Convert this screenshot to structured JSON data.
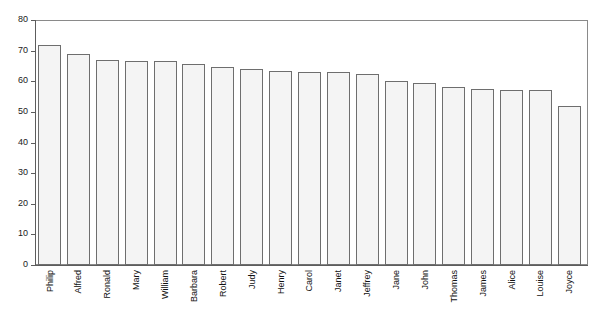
{
  "chart_data": {
    "type": "bar",
    "title": "",
    "subtitle": "",
    "xlabel": "",
    "ylabel": "",
    "ylim": [
      0,
      80
    ],
    "yticks": [
      0,
      10,
      20,
      30,
      40,
      50,
      60,
      70,
      80
    ],
    "ytick_labels": [
      "0",
      "10",
      "20",
      "30",
      "40",
      "50",
      "60",
      "70",
      "80"
    ],
    "grid": false,
    "legend": null,
    "categories": [
      "Philip",
      "Alfred",
      "Ronald",
      "Mary",
      "William",
      "Barbara",
      "Robert",
      "Judy",
      "Henry",
      "Carol",
      "Janet",
      "Jeffrey",
      "Jane",
      "John",
      "Thomas",
      "James",
      "Alice",
      "Louise",
      "Joyce"
    ],
    "values": [
      72,
      69,
      67,
      66.5,
      66.5,
      65.5,
      64.5,
      64,
      63.5,
      63,
      63,
      62.5,
      60,
      59.5,
      58,
      57.5,
      57,
      57,
      52
    ],
    "bar_fill_color": "#f4f4f4",
    "bar_border_color": "#6e6e6e",
    "axis_color": "#5d5d5d",
    "frame_color": "#8a8a8a",
    "background_color": "#ffffff"
  }
}
